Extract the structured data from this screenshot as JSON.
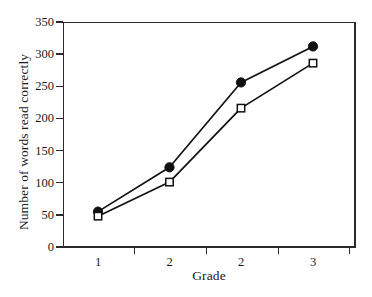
{
  "chart_data": {
    "type": "line",
    "title": "",
    "xlabel": "Grade",
    "ylabel": "Number of words read correctly",
    "categories": [
      "1",
      "2",
      "2",
      "3"
    ],
    "x_tick_labels": [
      "1",
      "2",
      "2",
      "3"
    ],
    "y_tick_labels": [
      "0",
      "50",
      "100",
      "150",
      "200",
      "250",
      "300",
      "350"
    ],
    "y_tick_values": [
      0,
      50,
      100,
      150,
      200,
      250,
      300,
      350
    ],
    "ylim": [
      0,
      350
    ],
    "grid": false,
    "legend": "none",
    "series": [
      {
        "name": "filled-circle-series",
        "marker": "filled-circle",
        "color": "#101010",
        "values": [
          55,
          124,
          256,
          312
        ]
      },
      {
        "name": "open-square-series",
        "marker": "open-square",
        "color": "#101010",
        "values": [
          48,
          101,
          216,
          286
        ]
      }
    ]
  },
  "axes": {
    "y_title": "Number of words read correctly",
    "x_title": "Grade"
  }
}
